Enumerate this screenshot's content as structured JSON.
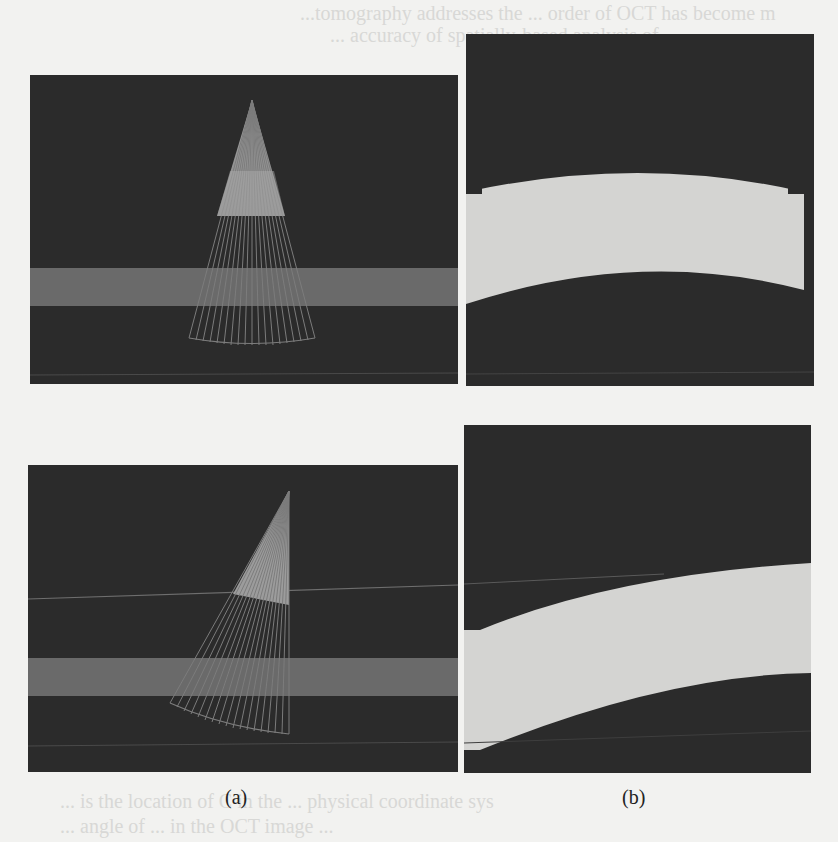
{
  "figure": {
    "subfigures": [
      {
        "id": "a",
        "caption": "(a)",
        "description": "Simulated fan-shaped scan beams over a layered sample (top: symmetric, bottom: tilted)"
      },
      {
        "id": "b",
        "caption": "(b)",
        "description": "Resulting distorted layer images (top: symmetric arc, bottom: skewed curve)"
      }
    ]
  },
  "background_text": {
    "line1": "...tomography addresses the ... order of OCT has become m",
    "line2": "... accuracy of spatially-based analysis of",
    "line_bottom1": "... is the location of C in the ... physical coordinate sys",
    "line_bottom2": "... angle of ... in the OCT image ..."
  },
  "colors": {
    "page": "#f2f2f0",
    "panel_bg": "#2b2b2b",
    "layer_band": "#6a6a6a",
    "beam_light": "#9a9a9a",
    "beam_line": "#7a7a7a",
    "bright_layer": "#d4d4d2"
  }
}
